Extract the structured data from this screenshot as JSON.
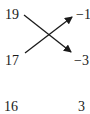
{
  "diagram": {
    "left_column": [
      "19",
      "17",
      "16"
    ],
    "right_column": [
      "−1",
      "−3",
      "3"
    ],
    "arrows": [
      {
        "from": "19",
        "to": "−3"
      },
      {
        "from": "17",
        "to": "−1"
      }
    ],
    "colors": {
      "ink": "#1a1a1a",
      "background": "#ffffff"
    }
  }
}
